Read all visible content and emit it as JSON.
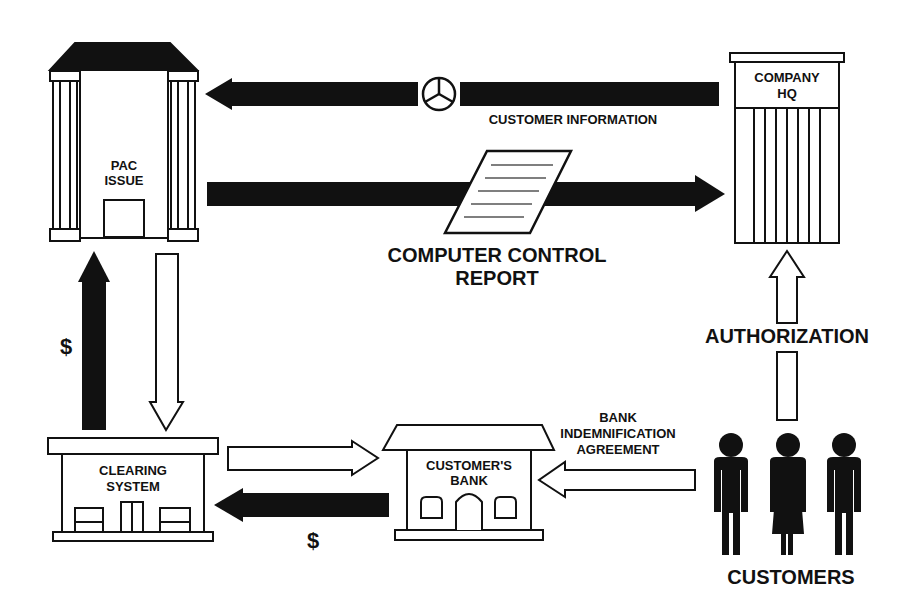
{
  "diagram": {
    "type": "flow",
    "nodes": {
      "pac_issue": {
        "line1": "PAC",
        "line2": "ISSUE"
      },
      "company_hq": {
        "line1": "COMPANY",
        "line2": "HQ"
      },
      "clearing_system": {
        "line1": "CLEARING",
        "line2": "SYSTEM"
      },
      "customers_bank": {
        "line1": "CUSTOMER'S",
        "line2": "BANK"
      },
      "customers": {
        "label": "CUSTOMERS"
      }
    },
    "labels": {
      "customer_information": "CUSTOMER INFORMATION",
      "computer_control_report_1": "COMPUTER CONTROL",
      "computer_control_report_2": "REPORT",
      "authorization": "AUTHORIZATION",
      "bank_indemnification_1": "BANK",
      "bank_indemnification_2": "INDEMNIFICATION",
      "bank_indemnification_3": "AGREEMENT",
      "dollar_left": "$",
      "dollar_bottom": "$"
    },
    "edges": [
      {
        "from": "company_hq",
        "to": "pac_issue",
        "label": "CUSTOMER INFORMATION",
        "style": "solid"
      },
      {
        "from": "pac_issue",
        "to": "company_hq",
        "label": "COMPUTER CONTROL REPORT",
        "style": "solid"
      },
      {
        "from": "customers",
        "to": "company_hq",
        "label": "AUTHORIZATION",
        "style": "outline"
      },
      {
        "from": "clearing_system",
        "to": "pac_issue",
        "label": "$",
        "style": "solid"
      },
      {
        "from": "pac_issue",
        "to": "clearing_system",
        "label": "",
        "style": "outline"
      },
      {
        "from": "clearing_system",
        "to": "customers_bank",
        "label": "",
        "style": "outline"
      },
      {
        "from": "customers_bank",
        "to": "clearing_system",
        "label": "$",
        "style": "solid"
      },
      {
        "from": "customers",
        "to": "customers_bank",
        "label": "BANK INDEMNIFICATION AGREEMENT",
        "style": "outline"
      }
    ],
    "colors": {
      "ink": "#111111",
      "paper": "#ffffff"
    }
  }
}
